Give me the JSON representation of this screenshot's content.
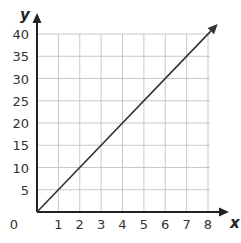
{
  "chart_data": {
    "type": "line",
    "title": "",
    "xlabel": "x",
    "ylabel": "y",
    "xlim": [
      0,
      8
    ],
    "ylim": [
      0,
      40
    ],
    "x_ticks": [
      1,
      2,
      3,
      4,
      5,
      6,
      7,
      8
    ],
    "y_ticks": [
      5,
      10,
      15,
      20,
      25,
      30,
      35,
      40
    ],
    "origin_label": "0",
    "grid": true,
    "legend": null,
    "series": [
      {
        "name": "y = 5x",
        "x": [
          0,
          1,
          2,
          3,
          4,
          5,
          6,
          7,
          8
        ],
        "y": [
          0,
          5,
          10,
          15,
          20,
          25,
          30,
          35,
          40
        ],
        "arrow_end": true
      }
    ]
  },
  "colors": {
    "grid": "#c8c8c8",
    "axis": "#222222",
    "line": "#333333"
  }
}
